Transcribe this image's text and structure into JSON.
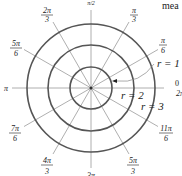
{
  "diagram": {
    "type": "polar-grid",
    "center": {
      "x": 91,
      "y": 88
    },
    "circles": [
      {
        "label": "r = 1",
        "radius_px": 21
      },
      {
        "label": "r = 2",
        "radius_px": 43
      },
      {
        "label": "r = 3",
        "radius_px": 64
      }
    ],
    "angle_labels": {
      "a0": "0",
      "a2pi": "2π",
      "pi6_n": "π",
      "pi6_d": "6",
      "pi3_n": "π",
      "pi3_d": "3",
      "pi2": "π/2",
      "twopi3_n": "2π",
      "twopi3_d": "3",
      "fivepi6_n": "5π",
      "fivepi6_d": "6",
      "pi": "π",
      "sevenpi6_n": "7π",
      "sevenpi6_d": "6",
      "fourpi3_n": "4π",
      "fourpi3_d": "3",
      "threepi2": "3π",
      "fivepi3_n": "5π",
      "fivepi3_d": "3",
      "elevenpi6_n": "11π",
      "elevenpi6_d": "6"
    },
    "radius_labels": {
      "r1": "r = 1",
      "r2": "r = 2",
      "r3": "r = 3"
    },
    "clipped_text": "mea",
    "colors": {
      "circle": "#555555",
      "ray": "#999999",
      "text": "#222222"
    }
  }
}
